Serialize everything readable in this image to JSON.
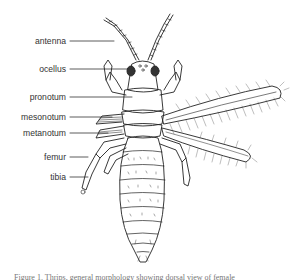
{
  "figure": {
    "labels": [
      {
        "id": "antenna",
        "text": "antenna",
        "x": 66,
        "y": 36
      },
      {
        "id": "ocellus",
        "text": "ocellus",
        "x": 66,
        "y": 64
      },
      {
        "id": "pronotum",
        "text": "pronotum",
        "x": 66,
        "y": 92
      },
      {
        "id": "mesonotum",
        "text": "mesonotum",
        "x": 66,
        "y": 112
      },
      {
        "id": "metanotum",
        "text": "metanotum",
        "x": 66,
        "y": 128
      },
      {
        "id": "femur",
        "text": "femur",
        "x": 66,
        "y": 152
      },
      {
        "id": "tibia",
        "text": "tibia",
        "x": 66,
        "y": 172
      }
    ],
    "caption": "Figure 1. Thrips, general morphology showing dorsal view of female"
  },
  "colors": {
    "ink": "#222222",
    "label_text": "#333333",
    "background": "#ffffff"
  }
}
